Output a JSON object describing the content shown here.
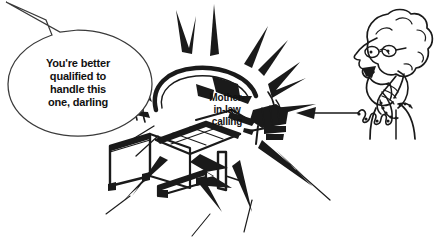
{
  "scene": {
    "title": "Mother-in-law calling cartoon",
    "background_color": "#ffffff",
    "ink_color": "#1a1a1a",
    "style": "black-and-white line-art cartoon"
  },
  "speech_balloon": {
    "name": "speech-balloon",
    "text": "You're better\nqualified to\nhandle this\none, darling",
    "tail_direction": "up-left",
    "outline_color": "#3a3a3a"
  },
  "machine_label": {
    "name": "mother-in-law-calling-label",
    "text": "Mother-\nin-law\ncalling"
  },
  "machine": {
    "name": "fax-copier-machine",
    "description": "office fax/copier machine with control keypad",
    "effect": "starburst-impact-lines"
  },
  "caller": {
    "name": "woman-on-telephone",
    "description": "woman with curly hair and glasses talking into a telephone handset",
    "accessories": [
      "glasses",
      "curly-hair",
      "telephone-handset",
      "coiled-cord"
    ]
  },
  "arrow": {
    "name": "pointing-arrow",
    "direction": "left",
    "description": "arrow running from the telephone cord to the machine"
  }
}
